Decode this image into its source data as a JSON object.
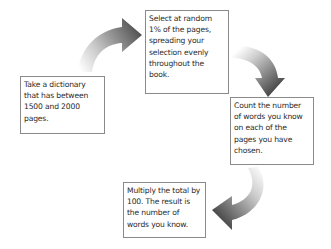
{
  "diagram": {
    "type": "cycle",
    "steps": [
      {
        "text": "Take a dictionary that has between 1500 and 2000 pages."
      },
      {
        "text": "Select at random 1% of the pages, spreading your selection evenly throughout the book."
      },
      {
        "text": "Count the number of words you know on each of the pages you have chosen."
      },
      {
        "text": "Multiply the total by 100. The result is the number of words you know."
      }
    ],
    "arrows": [
      {
        "from": 0,
        "to": 1,
        "direction": "up-right"
      },
      {
        "from": 1,
        "to": 2,
        "direction": "down"
      },
      {
        "from": 2,
        "to": 3,
        "direction": "down-left"
      }
    ],
    "colors": {
      "arrow_dark": "#4a4a4a",
      "arrow_light": "#ffffff",
      "box_border": "#8a8a8a",
      "text": "#2a2a2a"
    }
  }
}
